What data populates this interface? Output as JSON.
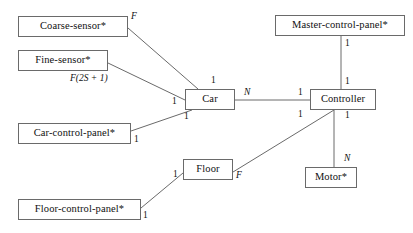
{
  "diagram": {
    "type": "entity-relationship-diagram",
    "title": "",
    "canvas": {
      "width": 413,
      "height": 233,
      "background": "#ffffff"
    },
    "style": {
      "box_border": "#6a6a6a",
      "edge_color": "#6a6a6a",
      "text_color": "#101010"
    },
    "entities": [
      {
        "id": "coarse-sensor",
        "label": "Coarse-sensor*",
        "x": 18,
        "y": 16,
        "w": 110,
        "h": 21
      },
      {
        "id": "fine-sensor",
        "label": "Fine-sensor*",
        "x": 18,
        "y": 50,
        "w": 90,
        "h": 21
      },
      {
        "id": "car-control-panel",
        "label": "Car-control-panel*",
        "x": 18,
        "y": 123,
        "w": 113,
        "h": 21
      },
      {
        "id": "floor-control-panel",
        "label": "Floor-control-panel*",
        "x": 18,
        "y": 199,
        "w": 123,
        "h": 21
      },
      {
        "id": "car",
        "label": "Car",
        "x": 185,
        "y": 89,
        "w": 50,
        "h": 21
      },
      {
        "id": "floor",
        "label": "Floor",
        "x": 183,
        "y": 159,
        "w": 50,
        "h": 21
      },
      {
        "id": "master-control-panel",
        "label": "Master-control-panel*",
        "x": 275,
        "y": 15,
        "w": 130,
        "h": 21
      },
      {
        "id": "controller",
        "label": "Controller",
        "x": 310,
        "y": 89,
        "w": 66,
        "h": 21
      },
      {
        "id": "motor",
        "label": "Motor*",
        "x": 305,
        "y": 167,
        "w": 52,
        "h": 21
      }
    ],
    "relationships": [
      {
        "id": "coarse-sensor--car",
        "from": "coarse-sensor",
        "to": "car",
        "from_card": "F",
        "to_card": "1"
      },
      {
        "id": "fine-sensor--car",
        "from": "fine-sensor",
        "to": "car",
        "from_card": "F(2S + 1)",
        "to_card": "1"
      },
      {
        "id": "car-control-panel--car",
        "from": "car-control-panel",
        "to": "car",
        "from_card": "1",
        "to_card": "1"
      },
      {
        "id": "car--controller",
        "from": "car",
        "to": "controller",
        "from_card": "N",
        "to_card": "1"
      },
      {
        "id": "master-control-panel--controller",
        "from": "master-control-panel",
        "to": "controller",
        "from_card": "1",
        "to_card": "1"
      },
      {
        "id": "floor--controller",
        "from": "floor",
        "to": "controller",
        "from_card": "F",
        "to_card": "1"
      },
      {
        "id": "floor-control-panel--floor",
        "from": "floor-control-panel",
        "to": "floor",
        "from_card": "1",
        "to_card": "1"
      },
      {
        "id": "controller--motor",
        "from": "controller",
        "to": "motor",
        "from_card": "1",
        "to_card": "N"
      }
    ],
    "cardinality_labels": [
      {
        "id": "card-coarse-F",
        "text": "F",
        "x": 131,
        "y": 12,
        "italic": true
      },
      {
        "id": "card-fine-F2S1",
        "text": "F(2S + 1)",
        "x": 70,
        "y": 74,
        "italic": true
      },
      {
        "id": "card-car-top",
        "text": "1",
        "x": 211,
        "y": 76,
        "italic": false
      },
      {
        "id": "card-car-left",
        "text": "1",
        "x": 172,
        "y": 97,
        "italic": false
      },
      {
        "id": "card-car-bottom",
        "text": "1",
        "x": 184,
        "y": 112,
        "italic": false
      },
      {
        "id": "card-car-right-N",
        "text": "N",
        "x": 244,
        "y": 88,
        "italic": true
      },
      {
        "id": "card-ccp-right",
        "text": "1",
        "x": 134,
        "y": 135,
        "italic": false
      },
      {
        "id": "card-mcp-bottom",
        "text": "1",
        "x": 345,
        "y": 39,
        "italic": false
      },
      {
        "id": "card-ctrl-top",
        "text": "1",
        "x": 345,
        "y": 77,
        "italic": false
      },
      {
        "id": "card-ctrl-left-top",
        "text": "1",
        "x": 298,
        "y": 88,
        "italic": false
      },
      {
        "id": "card-ctrl-left-bot",
        "text": "1",
        "x": 298,
        "y": 110,
        "italic": false
      },
      {
        "id": "card-ctrl-bot-right",
        "text": "1",
        "x": 345,
        "y": 111,
        "italic": false
      },
      {
        "id": "card-motor-N",
        "text": "N",
        "x": 344,
        "y": 154,
        "italic": true
      },
      {
        "id": "card-floor-left",
        "text": "1",
        "x": 173,
        "y": 170,
        "italic": false
      },
      {
        "id": "card-floor-right-F",
        "text": "F",
        "x": 236,
        "y": 171,
        "italic": true
      },
      {
        "id": "card-fcp-right",
        "text": "1",
        "x": 143,
        "y": 211,
        "italic": false
      }
    ],
    "edges": [
      {
        "id": "edge-coarse-sensor-car",
        "x1": 128,
        "y1": 28,
        "x2": 198,
        "y2": 89
      },
      {
        "id": "edge-fine-sensor-car",
        "x1": 108,
        "y1": 63,
        "x2": 185,
        "y2": 100
      },
      {
        "id": "edge-car-control-panel-car",
        "x1": 131,
        "y1": 131,
        "x2": 192,
        "y2": 110
      },
      {
        "id": "edge-car-controller",
        "x1": 235,
        "y1": 100,
        "x2": 310,
        "y2": 100
      },
      {
        "id": "edge-mcp-controller",
        "x1": 341,
        "y1": 36,
        "x2": 341,
        "y2": 89
      },
      {
        "id": "edge-floor-controller",
        "x1": 233,
        "y1": 172,
        "x2": 334,
        "y2": 110
      },
      {
        "id": "edge-fcp-floor",
        "x1": 141,
        "y1": 208,
        "x2": 183,
        "y2": 173
      },
      {
        "id": "edge-controller-motor",
        "x1": 334,
        "y1": 110,
        "x2": 334,
        "y2": 167
      }
    ]
  }
}
